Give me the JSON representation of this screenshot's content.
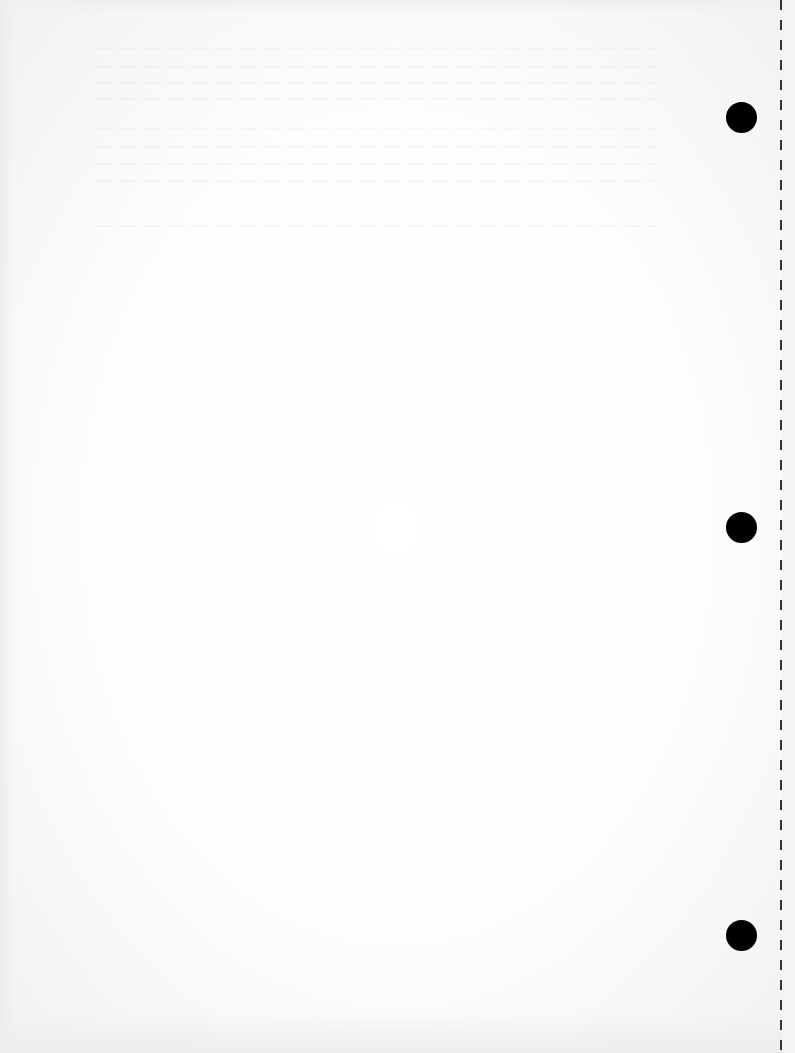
{
  "document": {
    "type": "blank scanned page",
    "text": "",
    "background_color": "#fafafa",
    "punch_holes": [
      {
        "cx": 741,
        "cy": 117,
        "r": 15
      },
      {
        "cx": 741,
        "cy": 527,
        "r": 15
      },
      {
        "cx": 741,
        "cy": 935,
        "r": 15
      }
    ],
    "perforation": {
      "x": 781,
      "style": "dashed",
      "color": "#333333"
    }
  }
}
